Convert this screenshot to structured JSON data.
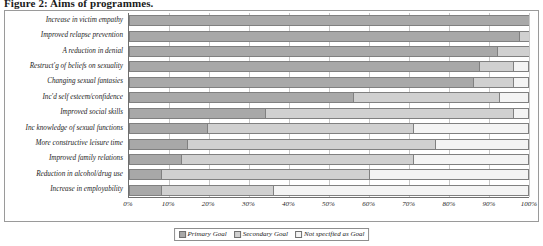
{
  "title": "Figure 2: Aims of programmes.",
  "legend": {
    "position": "bottom-center",
    "items": [
      {
        "label": "Primary Goal",
        "color": "#a8a8a8"
      },
      {
        "label": "Secondary Goal",
        "color": "#d0d0d0"
      },
      {
        "label": "Not specified as Goal",
        "color": "#f4f4f4"
      }
    ]
  },
  "axis": {
    "x_ticks": [
      "0%",
      "10%",
      "20%",
      "30%",
      "40%",
      "50%",
      "60%",
      "70%",
      "80%",
      "90%",
      "100%"
    ]
  },
  "chart_data": {
    "type": "bar",
    "orientation": "horizontal",
    "stacked": true,
    "stack_total": 100,
    "title": "Figure 2: Aims of programmes.",
    "xlabel": "",
    "ylabel": "",
    "xlim": [
      0,
      100
    ],
    "grid": true,
    "legend_position": "bottom-center",
    "unit": "%",
    "categories": [
      "Increase in victim empathy",
      "Improved relapse prevention",
      "A reduction in denial",
      "Restruct'g of beliefs on sexuality",
      "Changing sexual fantasies",
      "Inc'd self esteem/confidence",
      "Improved social skills",
      "Inc knowledge of sexual functions",
      "More constructive leisure time",
      "Improved family relations",
      "Reduction in alcohol/drug use",
      "Increase in employability"
    ],
    "series": [
      {
        "name": "Primary Goal",
        "color": "#a8a8a8",
        "values": [
          100,
          97.5,
          92,
          87.5,
          86,
          56,
          34,
          19.5,
          14.5,
          13,
          8,
          8
        ]
      },
      {
        "name": "Secondary Goal",
        "color": "#d0d0d0",
        "values": [
          0,
          2.5,
          8,
          8.5,
          10,
          36.5,
          62,
          51.5,
          62,
          58,
          52,
          28
        ]
      },
      {
        "name": "Not specified as Goal",
        "color": "#f4f4f4",
        "values": [
          0,
          0,
          0,
          4,
          4,
          7.5,
          4,
          29,
          23.5,
          29,
          40,
          64
        ]
      }
    ]
  }
}
